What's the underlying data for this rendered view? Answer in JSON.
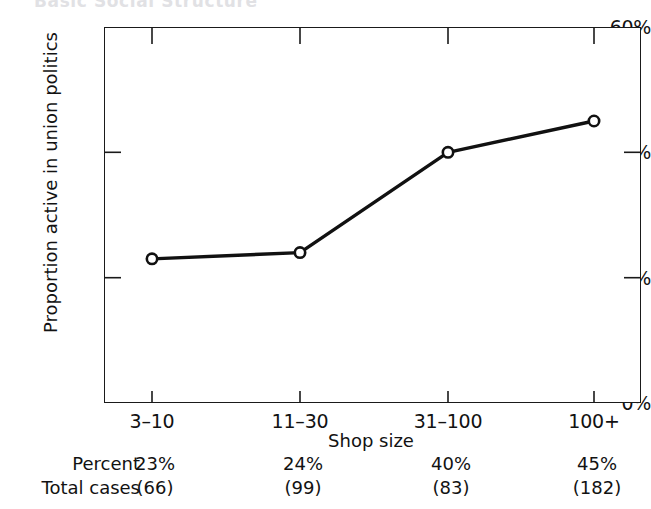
{
  "figure": {
    "cropped_title": "Basic Social Structure"
  },
  "chart_data": {
    "type": "line",
    "title": "",
    "xlabel": "Shop size",
    "ylabel": "Proportion active in union politics",
    "categories": [
      "3–10",
      "11–30",
      "31–100",
      "100+"
    ],
    "values": [
      23,
      24,
      40,
      45
    ],
    "value_labels": [
      "23%",
      "24%",
      "40%",
      "45%"
    ],
    "ylim": [
      0,
      60
    ],
    "yticks": [
      0,
      20,
      40,
      60
    ],
    "ytick_labels": [
      "0%",
      "20%",
      "40%",
      "60%"
    ],
    "grid": false,
    "legend": null,
    "marker": "open-circle",
    "line_color": "#111111"
  },
  "table": {
    "rows": [
      {
        "header": "Percent",
        "cells": [
          "23%",
          "24%",
          "40%",
          "45%"
        ]
      },
      {
        "header": "Total cases",
        "cells": [
          "(66)",
          "(99)",
          "(83)",
          "(182)"
        ]
      }
    ]
  }
}
